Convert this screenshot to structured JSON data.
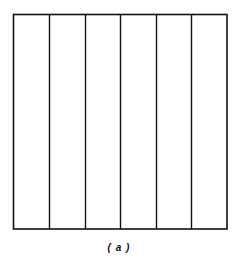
{
  "diagram": {
    "type": "square-divided-into-vertical-strips",
    "strip_count": 6,
    "stroke_color": "#111111",
    "outer_box": {
      "x": 13,
      "y": 14,
      "width": 214,
      "height": 215
    },
    "divider_x": [
      49,
      85,
      120,
      156,
      191
    ]
  },
  "caption": "( a )"
}
